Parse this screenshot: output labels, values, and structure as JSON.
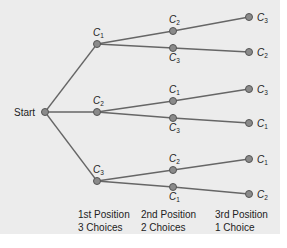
{
  "diagram": {
    "type": "tree",
    "root": {
      "label": "Start"
    },
    "levels": [
      {
        "line1": "1st Position",
        "line2": "3 Choices"
      },
      {
        "line1": "2nd Position",
        "line2": "2 Choices"
      },
      {
        "line1": "3rd Position",
        "line2": "1 Choice"
      }
    ],
    "branches": [
      {
        "label": "C",
        "sub": "1",
        "children": [
          {
            "label": "C",
            "sub": "2",
            "child": {
              "label": "C",
              "sub": "3"
            }
          },
          {
            "label": "C",
            "sub": "3",
            "child": {
              "label": "C",
              "sub": "2"
            }
          }
        ]
      },
      {
        "label": "C",
        "sub": "2",
        "children": [
          {
            "label": "C",
            "sub": "1",
            "child": {
              "label": "C",
              "sub": "3"
            }
          },
          {
            "label": "C",
            "sub": "3",
            "child": {
              "label": "C",
              "sub": "1"
            }
          }
        ]
      },
      {
        "label": "C",
        "sub": "3",
        "children": [
          {
            "label": "C",
            "sub": "2",
            "child": {
              "label": "C",
              "sub": "1"
            }
          },
          {
            "label": "C",
            "sub": "1",
            "child": {
              "label": "C",
              "sub": "2"
            }
          }
        ]
      }
    ]
  },
  "colors": {
    "background": "#ececec",
    "edge": "#666666",
    "node": "#8a8a8a"
  }
}
